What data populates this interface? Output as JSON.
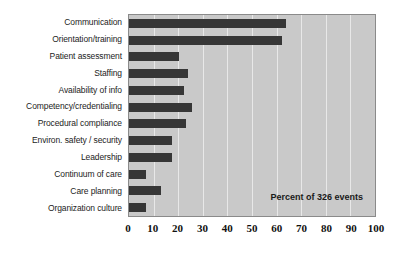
{
  "chart_data": {
    "type": "bar",
    "orientation": "horizontal",
    "title": "",
    "subtitle": "",
    "xlabel": "",
    "ylabel": "",
    "annotation": "Percent of 326 events",
    "xlim": [
      0,
      100
    ],
    "xticks": [
      0,
      10,
      20,
      30,
      40,
      50,
      60,
      70,
      80,
      90,
      100
    ],
    "xtick_labels": [
      "0",
      "10",
      "20",
      "30",
      "40",
      "50",
      "60",
      "70",
      "80",
      "90",
      "100"
    ],
    "grid": "vertical",
    "legend": "none",
    "categories": [
      "Communication",
      "Orientation/training",
      "Patient assessment",
      "Staffing",
      "Availability of info",
      "Competency/credentialing",
      "Procedural compliance",
      "Environ. safety / security",
      "Leadership",
      "Continuum of care",
      "Care planning",
      "Organization culture"
    ],
    "values": [
      64,
      62,
      20.5,
      24,
      22.5,
      25.5,
      23,
      17.5,
      17.5,
      7,
      13,
      7
    ],
    "bar_color": "#363636",
    "plot_background": "#c9c9c9",
    "gridline_color": "#e8e8e8",
    "page_background": "#ffffff"
  }
}
